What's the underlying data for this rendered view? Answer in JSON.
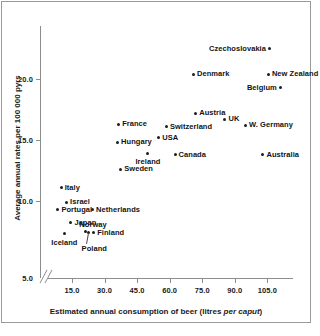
{
  "chart_data": {
    "type": "scatter",
    "title": "",
    "xlabel": "Estimated annual consumption of beer (litres per caput)",
    "xlabel_plain": "Estimated annual consumption of beer (litres ",
    "xlabel_italic": "per caput",
    "xlabel_tail": ")",
    "ylabel": "Average annual rates per 100 000 pyrs",
    "xlim": [
      3.0,
      118.0
    ],
    "ylim": [
      5.0,
      23.2
    ],
    "axis_break_y": true,
    "grid": false,
    "legend": false,
    "xticks": [
      "15.0",
      "30.0",
      "45.0",
      "60.0",
      "75.0",
      "90.0",
      "105.0"
    ],
    "xtick_values": [
      15.0,
      30.0,
      45.0,
      60.0,
      75.0,
      90.0,
      105.0
    ],
    "yticks": [
      "5.0",
      "10.0",
      "15.0",
      "20.0"
    ],
    "ytick_values": [
      5.0,
      10.0,
      15.0,
      20.0
    ],
    "marker_color": "#1d1d1d",
    "axis_color": "#8d8d8d",
    "points": [
      {
        "label": "Czechoslovakia",
        "x": 106.0,
        "y": 22.5,
        "label_side": "left"
      },
      {
        "label": "Denmark",
        "x": 71.0,
        "y": 20.4,
        "label_side": "right"
      },
      {
        "label": "New Zealand",
        "x": 105.5,
        "y": 20.4,
        "label_side": "right"
      },
      {
        "label": "Belgium",
        "x": 111.0,
        "y": 19.3,
        "label_side": "left"
      },
      {
        "label": "Austria",
        "x": 72.0,
        "y": 17.2,
        "label_side": "right"
      },
      {
        "label": "UK",
        "x": 85.5,
        "y": 16.7,
        "label_side": "right"
      },
      {
        "label": "W. Germany",
        "x": 95.0,
        "y": 16.2,
        "label_side": "right"
      },
      {
        "label": "Switzerland",
        "x": 58.5,
        "y": 16.1,
        "label_side": "right"
      },
      {
        "label": "France",
        "x": 36.5,
        "y": 16.3,
        "label_side": "right"
      },
      {
        "label": "USA",
        "x": 55.0,
        "y": 15.2,
        "label_side": "right"
      },
      {
        "label": "Hungary",
        "x": 36.0,
        "y": 14.8,
        "label_side": "right"
      },
      {
        "label": "Canada",
        "x": 62.5,
        "y": 13.8,
        "label_side": "right"
      },
      {
        "label": "Australia",
        "x": 103.0,
        "y": 13.8,
        "label_side": "right"
      },
      {
        "label": "Ireland",
        "x": 50.0,
        "y": 13.9,
        "label_side": "below"
      },
      {
        "label": "Sweden",
        "x": 37.5,
        "y": 12.6,
        "label_side": "right"
      },
      {
        "label": "Italy",
        "x": 10.0,
        "y": 11.1,
        "label_side": "right"
      },
      {
        "label": "Israel",
        "x": 12.5,
        "y": 9.9,
        "label_side": "right"
      },
      {
        "label": "Portugal",
        "x": 8.5,
        "y": 9.3,
        "label_side": "right"
      },
      {
        "label": "Netherlands",
        "x": 24.5,
        "y": 9.3,
        "label_side": "right"
      },
      {
        "label": "Japan",
        "x": 14.5,
        "y": 8.2,
        "label_side": "right"
      },
      {
        "label": "Norway",
        "x": 21.0,
        "y": 7.5,
        "label_side": "above"
      },
      {
        "label": "Finland",
        "x": 25.0,
        "y": 7.4,
        "label_side": "right"
      },
      {
        "label": "Poland",
        "x": 22.5,
        "y": 7.4,
        "label_side": "below-leader"
      },
      {
        "label": "Iceland",
        "x": 11.5,
        "y": 7.3,
        "label_side": "below"
      }
    ]
  }
}
